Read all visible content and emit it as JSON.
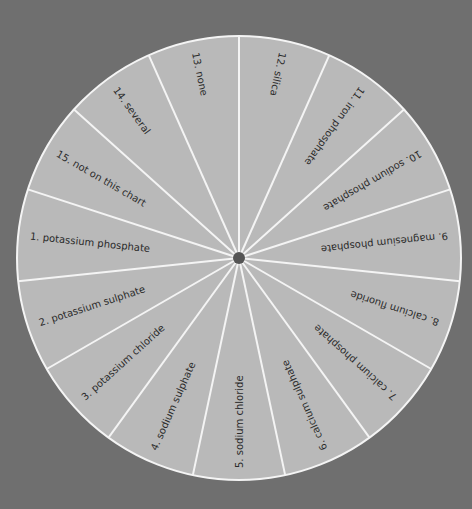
{
  "wheel": {
    "center": [
      239,
      258
    ],
    "radius": 222,
    "fill_color": "#b9b9b9",
    "line_color": "#f4f4f4",
    "hub_color": "#555555",
    "background_color": "#6f6f6f",
    "segments": [
      {
        "number": 1,
        "label": "1.  potassium phosphate",
        "angle": 276
      },
      {
        "number": 2,
        "label": "2.  potassium sulphate",
        "angle": 252
      },
      {
        "number": 3,
        "label": "3.  potassium chloride",
        "angle": 228
      },
      {
        "number": 4,
        "label": "4.  sodium sulphate",
        "angle": 204
      },
      {
        "number": 5,
        "label": "5.  sodium chloride",
        "angle": 180
      },
      {
        "number": 6,
        "label": "6.  calcium sulphate",
        "angle": 156
      },
      {
        "number": 7,
        "label": "7.  calcium phosphate",
        "angle": 132
      },
      {
        "number": 8,
        "label": "8.  calcium fluoride",
        "angle": 108
      },
      {
        "number": 9,
        "label": "9.  magnesium phosphate",
        "angle": 84
      },
      {
        "number": 10,
        "label": "10.  sodium phosphate",
        "angle": 60
      },
      {
        "number": 11,
        "label": "11.  iron phosphate",
        "angle": 36
      },
      {
        "number": 12,
        "label": "12.  silica",
        "angle": 12
      },
      {
        "number": 13,
        "label": "13.  none",
        "angle": 348
      },
      {
        "number": 14,
        "label": "14.  several",
        "angle": 324
      },
      {
        "number": 15,
        "label": "15.  not on this chart",
        "angle": 300
      }
    ]
  }
}
